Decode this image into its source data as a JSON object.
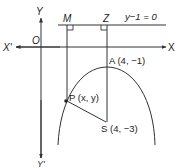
{
  "diagram": {
    "type": "parabola-focus-directrix",
    "axes": {
      "x_positive": "X",
      "x_negative": "X'",
      "y_positive": "Y",
      "y_negative": "Y'",
      "origin": "O"
    },
    "directrix": {
      "label": "y−1 = 0"
    },
    "points": {
      "M": {
        "label": "M"
      },
      "Z": {
        "label": "Z"
      },
      "A": {
        "label": "A (4, −1)"
      },
      "P": {
        "label": "P (x, y)"
      },
      "S": {
        "label": "S (4, −3)"
      }
    },
    "colors": {
      "line": "#333333",
      "text": "#222222",
      "background": "#ffffff"
    }
  }
}
